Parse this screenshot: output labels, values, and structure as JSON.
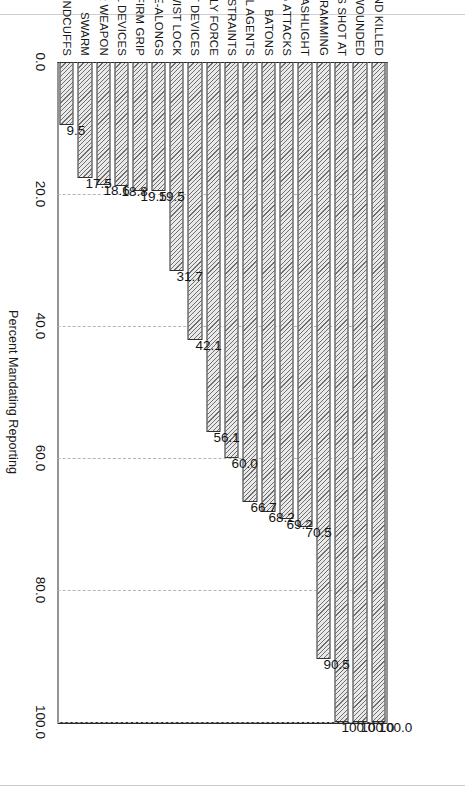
{
  "chart_data": {
    "type": "bar",
    "orientation": "vertical-rotated",
    "title": "",
    "subtitle": "",
    "xlabel": "",
    "ylabel": "Percent Mandating Reporting",
    "ylim": [
      0.0,
      100.0
    ],
    "grid": true,
    "legend": null,
    "tick_labels": [
      "0.0",
      "20.0",
      "40.0",
      "60.0",
      "80.0",
      "100.0"
    ],
    "ticks": [
      0.0,
      20.0,
      40.0,
      60.0,
      80.0,
      100.0
    ],
    "categories": [
      "CIVILIANS SHOT AND KILLED",
      "CIVILIANS SHOT AND WOUNDED",
      "CIVILIANS SHOT AT",
      "VEHICLE RAMMING",
      "FLASHLIGHT",
      "DOG ATTACKS",
      "BATONS",
      "CHEMICAL AGENTS",
      "NECK RESTRAINTS",
      "BODILY FORCE",
      "OTHER IMPACT DEVICES",
      "TWIST LOCK",
      "COME-ALONGS",
      "FIRM GRIP",
      "ELECTRICAL DEVICES",
      "UNHOLSTER WEAPON",
      "SWARM",
      "HANDCUFFS"
    ],
    "values": [
      100.0,
      100.0,
      100.0,
      90.5,
      70.5,
      69.2,
      68.2,
      66.7,
      60.0,
      56.1,
      42.1,
      31.7,
      19.5,
      19.5,
      18.8,
      18.6,
      17.5,
      9.5
    ],
    "value_labels": [
      "100.0",
      "100.0",
      "100.0",
      "90.5",
      "70.5",
      "69.2",
      "68.2",
      "66.7",
      "60.0",
      "56.1",
      "42.1",
      "31.7",
      "19.5",
      "19.5",
      "18.8",
      "18.6",
      "17.5",
      "9.5"
    ],
    "bar_fill": "hatched-diagonal",
    "bar_edge_color": "#303030"
  }
}
